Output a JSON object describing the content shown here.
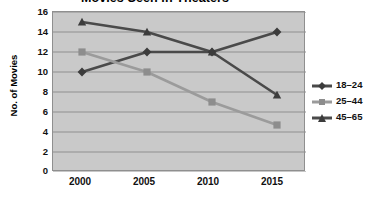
{
  "chart_data": {
    "type": "line",
    "title": "Movies Seen in Theaters",
    "xlabel": "",
    "ylabel": "No. of Movies",
    "categories": [
      "2000",
      "2005",
      "2010",
      "2015"
    ],
    "x": [
      2000,
      2005,
      2010,
      2015
    ],
    "ylim": [
      0,
      16
    ],
    "ytick_step": 2,
    "yticks": [
      "16",
      "14",
      "12",
      "10",
      "8",
      "6",
      "4",
      "2",
      "0"
    ],
    "grid": "horizontal",
    "legend_position": "right",
    "plot_background": "#c9c9c9",
    "series": [
      {
        "name": "18–24",
        "values": [
          10,
          12,
          12,
          14
        ],
        "color": "#4a4a4a",
        "marker": "diamond"
      },
      {
        "name": "25–44",
        "values": [
          12,
          10,
          7,
          4.7
        ],
        "color": "#9b9b9b",
        "marker": "square"
      },
      {
        "name": "45–65",
        "values": [
          15,
          14,
          12,
          7.7
        ],
        "color": "#4a4a4a",
        "marker": "triangle"
      }
    ]
  },
  "legend": {
    "items": [
      {
        "label": "18–24",
        "marker_name": "diamond-marker"
      },
      {
        "label": "25–44",
        "marker_name": "square-marker"
      },
      {
        "label": "45–65",
        "marker_name": "triangle-marker"
      }
    ]
  }
}
